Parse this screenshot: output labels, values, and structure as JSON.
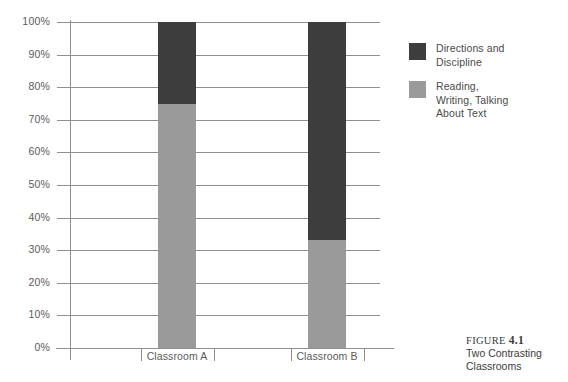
{
  "chart_data": {
    "type": "bar",
    "stacked": true,
    "title": "",
    "xlabel": "",
    "ylabel": "",
    "categories": [
      "Classroom A",
      "Classroom B"
    ],
    "series": [
      {
        "name": "Reading, Writing, Talking About Text",
        "values": [
          75,
          33
        ],
        "color": "#9a9a9a"
      },
      {
        "name": "Directions and Discipline",
        "values": [
          25,
          67
        ],
        "color": "#3d3d3d"
      }
    ],
    "ylim": [
      0,
      100
    ],
    "yticks": [
      0,
      10,
      20,
      30,
      40,
      50,
      60,
      70,
      80,
      90,
      100
    ],
    "ytick_labels": [
      "0%",
      "10%",
      "20%",
      "30%",
      "40%",
      "50%",
      "60%",
      "70%",
      "80%",
      "90%",
      "100%"
    ],
    "grid": true,
    "legend_position": "right"
  },
  "legend": {
    "entries": [
      {
        "label": "Directions and\nDiscipline",
        "color": "#3d3d3d"
      },
      {
        "label": "Reading,\nWriting, Talking\nAbout Text",
        "color": "#9a9a9a"
      }
    ]
  },
  "caption": {
    "prefix": "FIGURE ",
    "number": "4.1",
    "body": "Two Contrasting\nClassrooms"
  }
}
